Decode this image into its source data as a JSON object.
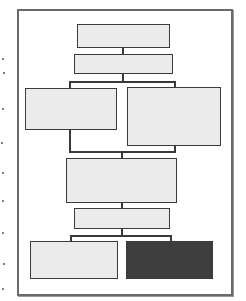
{
  "diagram": {
    "type": "flowchart",
    "frame": {
      "x": 17,
      "y": 9,
      "w": 212,
      "h": 283,
      "border": "#6a6a6a"
    },
    "colors": {
      "light_fill": "#ebebeb",
      "dark_fill": "#505050",
      "stroke": "#3a3a3a"
    },
    "nodes": [
      {
        "id": "n1",
        "x": 77,
        "y": 24,
        "w": 93,
        "h": 24,
        "fill": "light",
        "label": ""
      },
      {
        "id": "n2",
        "x": 74,
        "y": 54,
        "w": 99,
        "h": 20,
        "fill": "light",
        "label": ""
      },
      {
        "id": "n3",
        "x": 25,
        "y": 88,
        "w": 92,
        "h": 42,
        "fill": "light",
        "label": ""
      },
      {
        "id": "n4",
        "x": 127,
        "y": 87,
        "w": 94,
        "h": 59,
        "fill": "light",
        "label": ""
      },
      {
        "id": "n5",
        "x": 66,
        "y": 158,
        "w": 111,
        "h": 45,
        "fill": "light",
        "label": ""
      },
      {
        "id": "n6",
        "x": 74,
        "y": 208,
        "w": 96,
        "h": 21,
        "fill": "light",
        "label": ""
      },
      {
        "id": "n7",
        "x": 30,
        "y": 241,
        "w": 88,
        "h": 38,
        "fill": "light",
        "label": ""
      },
      {
        "id": "n8",
        "x": 126,
        "y": 241,
        "w": 87,
        "h": 38,
        "fill": "dark",
        "label": ""
      }
    ],
    "edges": [
      {
        "from": "n1",
        "to": "n2"
      },
      {
        "from": "n2",
        "to": "n3"
      },
      {
        "from": "n2",
        "to": "n4"
      },
      {
        "from": "n3",
        "to": "n5"
      },
      {
        "from": "n4",
        "to": "n5"
      },
      {
        "from": "n5",
        "to": "n6"
      },
      {
        "from": "n6",
        "to": "n7"
      },
      {
        "from": "n6",
        "to": "n8"
      }
    ],
    "margin_marks": [
      58,
      72,
      108,
      142,
      172,
      200,
      232,
      263,
      288
    ]
  }
}
